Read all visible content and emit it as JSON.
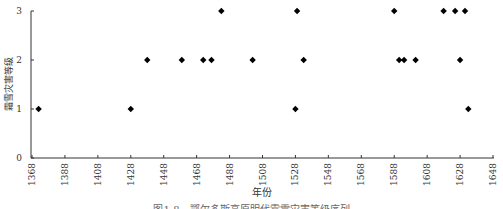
{
  "chart_data": {
    "type": "scatter",
    "title": "",
    "xlabel": "年份",
    "ylabel": "霜雪灾害等级",
    "xlim": [
      1368,
      1648
    ],
    "ylim": [
      0,
      3
    ],
    "x_ticks": [
      1368,
      1388,
      1408,
      1428,
      1448,
      1468,
      1488,
      1508,
      1528,
      1548,
      1568,
      1588,
      1608,
      1628,
      1648
    ],
    "y_ticks": [
      0,
      1,
      2,
      3
    ],
    "grid": false,
    "legend": null,
    "marker": "diamond",
    "marker_color": "#000000",
    "series": [
      {
        "name": "霜雪灾害等级",
        "points": [
          {
            "x": 1372,
            "y": 1
          },
          {
            "x": 1428,
            "y": 1
          },
          {
            "x": 1438,
            "y": 2
          },
          {
            "x": 1459,
            "y": 2
          },
          {
            "x": 1472,
            "y": 2
          },
          {
            "x": 1477,
            "y": 2
          },
          {
            "x": 1483,
            "y": 3
          },
          {
            "x": 1502,
            "y": 2
          },
          {
            "x": 1528,
            "y": 1
          },
          {
            "x": 1529,
            "y": 3
          },
          {
            "x": 1533,
            "y": 2
          },
          {
            "x": 1588,
            "y": 3
          },
          {
            "x": 1591,
            "y": 2
          },
          {
            "x": 1594,
            "y": 2
          },
          {
            "x": 1601,
            "y": 2
          },
          {
            "x": 1618,
            "y": 3
          },
          {
            "x": 1625,
            "y": 3
          },
          {
            "x": 1628,
            "y": 2
          },
          {
            "x": 1631,
            "y": 3
          },
          {
            "x": 1633,
            "y": 1
          }
        ]
      }
    ]
  },
  "caption": "图1-8　鄂尔多斯高原明代霜雪灾害等级序列"
}
